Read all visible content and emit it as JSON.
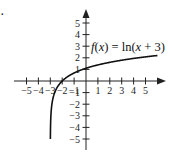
{
  "chart_data": {
    "type": "line",
    "title": "",
    "function_label": "f(x) = ln(x + 3)",
    "function_label_parts": {
      "f": "f",
      "x1": "x",
      "rest1": ") = ln(",
      "x2": "x",
      "rest2": " + 3)"
    },
    "xlabel": "",
    "ylabel": "",
    "xlim": [
      -5.5,
      6.5
    ],
    "ylim": [
      -5.5,
      6.2
    ],
    "grid": false,
    "legend": "none",
    "x_tick_labels": [
      "−5",
      "−4",
      "−3",
      "−2",
      "−1",
      "1",
      "2",
      "3",
      "4",
      "5"
    ],
    "x_ticks": [
      -5,
      -4,
      -3,
      -2,
      -1,
      1,
      2,
      3,
      4,
      5
    ],
    "y_tick_labels": [
      "5",
      "4",
      "3",
      "2",
      "1",
      "−1",
      "−2",
      "−3",
      "−4",
      "−5"
    ],
    "y_ticks": [
      5,
      4,
      3,
      2,
      1,
      -1,
      -2,
      -3,
      -4,
      -5
    ],
    "series": [
      {
        "name": "f(x) = ln(x + 3)",
        "x": [
          -2.9933,
          -2.98,
          -2.95,
          -2.9,
          -2.8,
          -2.6,
          -2.3,
          -2.0,
          -1.5,
          -1.0,
          0.0,
          1.0,
          2.0,
          3.0,
          4.0,
          5.0,
          6.0
        ],
        "y": [
          -5.0,
          -3.91,
          -3.0,
          -2.3,
          -1.61,
          -0.92,
          -0.36,
          0.0,
          0.41,
          0.69,
          1.1,
          1.39,
          1.61,
          1.79,
          1.95,
          2.08,
          2.2
        ]
      }
    ],
    "asymptote": "x = -3"
  },
  "marks": {
    "corner_dot": "."
  }
}
